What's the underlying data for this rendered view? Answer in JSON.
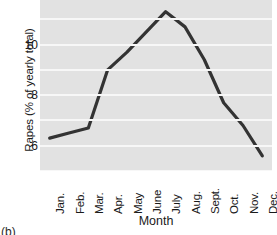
{
  "chart_data": {
    "type": "line",
    "title": "",
    "xlabel": "Month",
    "ylabel": "Rapes (% of yearly total)",
    "categories": [
      "Jan.",
      "Feb.",
      "Mar.",
      "Apr.",
      "May",
      "June",
      "July",
      "Aug.",
      "Sept.",
      "Oct.",
      "Nov.",
      "Dec."
    ],
    "values": [
      6.3,
      6.5,
      6.7,
      9.0,
      9.7,
      10.5,
      11.3,
      10.7,
      9.4,
      7.7,
      6.8,
      5.6
    ],
    "ylim": [
      5.0,
      12.0
    ],
    "yticks": [
      6,
      8,
      10,
      12
    ],
    "ytick_labels": [
      "6",
      "8",
      "10",
      "12"
    ],
    "grid": true,
    "grid_axis": "y",
    "legend": false,
    "series_color": "#333333",
    "plot_background": "#e2e2e2",
    "gridline_color": "#f7f7f7"
  },
  "figure": {
    "caption_fragment": "(b)"
  }
}
